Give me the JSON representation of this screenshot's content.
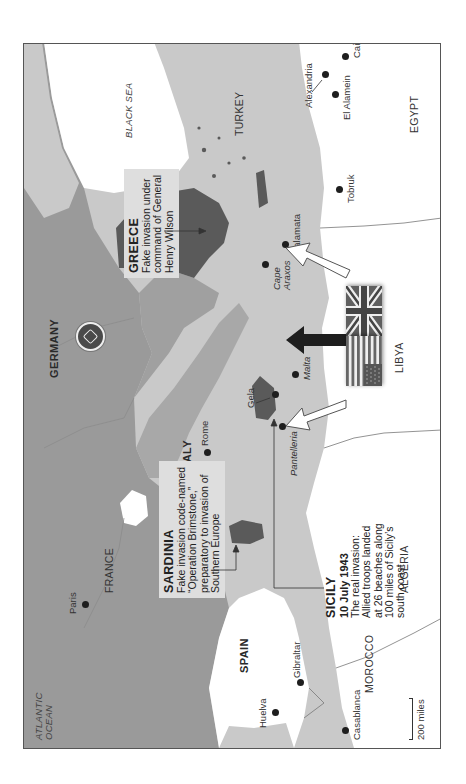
{
  "map": {
    "title": "Allied invasion of Sicily and deception operations, 1943",
    "orientation": "rotated-90-ccw",
    "colors": {
      "sea": "#c9c9c9",
      "axis_land": "#9a9a9a",
      "italy_land": "#a8a8a8",
      "target_dark": "#5a5a5a",
      "neutral_land": "#ffffff",
      "callout_bg": "#dedede"
    },
    "water_labels": {
      "atlantic": [
        "ATLANTIC",
        "OCEAN"
      ],
      "black_sea": "BLACK SEA"
    },
    "countries": {
      "germany": "GERMANY",
      "france": "FRANCE",
      "italy": "ITALY",
      "spain": "SPAIN",
      "turkey": "TURKEY",
      "morocco": "MOROCCO",
      "algeria": "ALGERIA",
      "libya": "LIBYA",
      "egypt": "EGYPT"
    },
    "cities": {
      "paris": "Paris",
      "rome": "Rome",
      "huelva": "Huelva",
      "gibraltar": "Gibraltar",
      "casablanca": "Casablanca",
      "gela": "Gela",
      "malta": "Malta",
      "pantelleria": "Pantelleria",
      "cape_araxos": [
        "Cape",
        "Araxos"
      ],
      "kalamata": "Kalamata",
      "tobruk": "Tobruk",
      "el_alamein": "El Alamein",
      "alexandria": "Alexandria",
      "cairo": "Cairo"
    },
    "callouts": {
      "greece": {
        "title": "GREECE",
        "lines": [
          "Fake invasion under",
          "command of General",
          "Henry Wilson"
        ]
      },
      "sardinia": {
        "title": "SARDINIA",
        "lines": [
          "Fake invasion code-named",
          "“Operation Brimstone,”",
          "preparatory to invasion of",
          "Southern Europe"
        ]
      },
      "sicily": {
        "title": "SICILY",
        "date": "10 July 1943",
        "lines": [
          "The real invasion:",
          "Allied troops landed",
          "at 26 beaches along",
          "100 miles of Sicily’s",
          "south coast"
        ]
      }
    },
    "markers": {
      "axis_emblem": "axis-power-marker"
    },
    "flags": [
      "united-kingdom",
      "united-states"
    ],
    "arrows": [
      {
        "name": "arrow-to-greece",
        "style": "white"
      },
      {
        "name": "arrow-to-sicily",
        "style": "black"
      },
      {
        "name": "arrow-to-sardinia",
        "style": "white"
      }
    ],
    "scale": {
      "label": "200 miles"
    }
  }
}
